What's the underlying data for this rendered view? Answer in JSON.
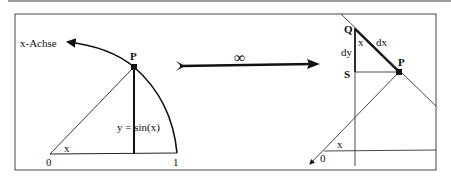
{
  "left_panel": {
    "axis_label": "x-Achse",
    "point_label": "P",
    "sine_label": "y = sin(x)",
    "angle_label": "x",
    "origin_label": "0",
    "one_label": "1"
  },
  "middle": {
    "limit_symbol": "∞"
  },
  "right_panel": {
    "q_label": "Q",
    "s_label": "S",
    "p_label": "P",
    "dx_label": "dx",
    "dy_label": "dy",
    "angle_top_label": "x",
    "angle_bottom_label": "x",
    "origin_label": "0"
  },
  "colors": {
    "line": "#111111",
    "thin_line": "#333333",
    "frame": "#444444",
    "top_rule": "#999999"
  }
}
